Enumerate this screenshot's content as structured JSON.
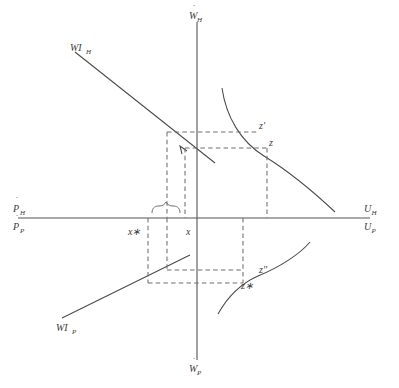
{
  "diagram": {
    "type": "economics-four-quadrant",
    "colors": {
      "axis": "#555555",
      "curve": "#4a4a4a",
      "dashed": "#6e6e6e",
      "text": "#3b3b3b",
      "background": "#ffffff"
    }
  },
  "axes": {
    "vertical_top": {
      "label_base": "W",
      "label_sub": "H",
      "has_dot": true,
      "full_text": "ẆH"
    },
    "vertical_bottom": {
      "label_base": "W",
      "label_sub": "P",
      "has_dot": true,
      "full_text": "ẆP"
    },
    "left_upper": {
      "label_base": "P",
      "label_sub": "H",
      "has_dot": true,
      "full_text": "ṖH"
    },
    "left_lower": {
      "label_base": "P",
      "label_sub": "P",
      "has_dot": true,
      "full_text": "ṖP"
    },
    "right_upper": {
      "label_base": "U",
      "label_sub": "H",
      "has_dot": false,
      "full_text": "UH"
    },
    "right_lower": {
      "label_base": "U",
      "label_sub": "P",
      "has_dot": false,
      "full_text": "UP"
    }
  },
  "curves": {
    "wi_upper": {
      "label_base": "WI",
      "label_sub": "H",
      "full_text": "WIH",
      "kind": "wage-inflation-line",
      "slope": "negative"
    },
    "wi_lower": {
      "label_base": "WI",
      "label_sub": "P",
      "full_text": "WIP",
      "kind": "wage-inflation-line",
      "slope": "positive"
    },
    "phillips_upper": {
      "kind": "phillips-curve",
      "quadrant": "upper-right",
      "shape": "convex-decreasing"
    },
    "phillips_lower": {
      "kind": "phillips-curve",
      "quadrant": "lower-right",
      "shape": "concave-increasing"
    }
  },
  "points": [
    {
      "id": "z-prime",
      "label": "z′",
      "quadrant": "upper-right"
    },
    {
      "id": "z",
      "label": "z",
      "quadrant": "upper-right"
    },
    {
      "id": "z-double-prime",
      "label": "z′′",
      "quadrant": "lower-right"
    },
    {
      "id": "z-star",
      "label": "z∗",
      "quadrant": "lower-right"
    }
  ],
  "tick_labels": [
    {
      "id": "x-star",
      "label": "x∗",
      "axis": "horizontal",
      "position": "left-of-origin"
    },
    {
      "id": "x",
      "label": "x",
      "axis": "horizontal",
      "position": "near-origin"
    }
  ],
  "annotations": {
    "brace": {
      "id": "gap-brace",
      "spans": "x∗ to x",
      "orientation": "up"
    },
    "arrow": {
      "id": "wi-arrow",
      "direction": "up-left",
      "on": "WIH line"
    }
  }
}
